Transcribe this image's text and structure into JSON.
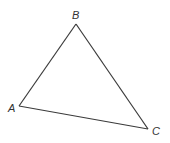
{
  "diagram": {
    "type": "triangle",
    "line_color": "#3a3a3a",
    "label_color": "#333333",
    "vertices": {
      "A": {
        "label": "A",
        "x": 19,
        "y": 106,
        "label_x": 8,
        "label_y": 112
      },
      "B": {
        "label": "B",
        "x": 76,
        "y": 24,
        "label_x": 72,
        "label_y": 19
      },
      "C": {
        "label": "C",
        "x": 148,
        "y": 129,
        "label_x": 152,
        "label_y": 135
      }
    },
    "edges": [
      {
        "from": "A",
        "to": "B"
      },
      {
        "from": "B",
        "to": "C"
      },
      {
        "from": "C",
        "to": "A"
      }
    ]
  }
}
